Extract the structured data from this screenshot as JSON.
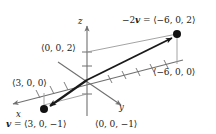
{
  "figure": {
    "type": "3d-vector-diagram",
    "background_color": "#ffffff",
    "line_color": "#808080",
    "vector_color": "#1a1a1a",
    "text_color": "#1a1a1a"
  },
  "axes": [
    {
      "name": "x",
      "label": "x",
      "label_x": 16,
      "label_y": 116
    },
    {
      "name": "y",
      "label": "y",
      "label_x": 120,
      "label_y": 110
    },
    {
      "name": "z",
      "label": "z",
      "label_x": 79,
      "label_y": 20
    }
  ],
  "labels": {
    "neg2v": "−2v = ⟨−6, 0, 2⟩",
    "neg2v_prefix": "−2",
    "neg2v_vecname": "v",
    "neg2v_suffix": " = ⟨−6, 0, 2⟩",
    "z_intercept": "⟨0, 0, 2⟩",
    "x_point": "⟨3, 0, 0⟩",
    "neg_x_point": "⟨−6, 0, 0⟩",
    "neg_z_intercept": "⟨0, 0, −1⟩",
    "v_prefix": "v",
    "v_suffix": " = ⟨3, 0, −1⟩",
    "v_full": "v = ⟨3, 0, −1⟩"
  },
  "points": [
    {
      "name": "point-neg2v",
      "label": "⟨−6, 0, 2⟩",
      "x": 177,
      "y": 34,
      "filled": true
    },
    {
      "name": "point-v",
      "label": "⟨3, 0, −1⟩",
      "x": 44,
      "y": 109,
      "filled": true
    }
  ],
  "vectors": [
    {
      "name": "vector-neg2v",
      "from": "origin",
      "to": "point-neg2v",
      "label": "−2v"
    },
    {
      "name": "vector-v",
      "from": "origin",
      "to": "point-v",
      "label": "v"
    }
  ],
  "origin": {
    "x": 87,
    "y": 80
  }
}
